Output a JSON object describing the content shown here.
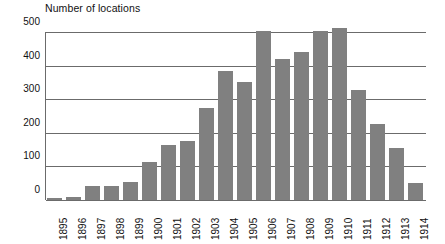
{
  "chart_data": {
    "type": "bar",
    "title": "Number of locations",
    "xlabel": "",
    "ylabel": "",
    "ylim": [
      0,
      500
    ],
    "yticks": [
      0,
      100,
      200,
      300,
      400,
      500
    ],
    "grid": true,
    "legend": false,
    "legend_position": "none",
    "bar_color": "#808080",
    "axis_color": "#6b6b6b",
    "categories": [
      "1895",
      "1896",
      "1897",
      "1898",
      "1899",
      "1900",
      "1901",
      "1902",
      "1903",
      "1904",
      "1905",
      "1906",
      "1907",
      "1908",
      "1909",
      "1910",
      "1911",
      "1912",
      "1913",
      "1914"
    ],
    "values": [
      6,
      8,
      43,
      41,
      54,
      113,
      165,
      177,
      275,
      383,
      352,
      503,
      421,
      440,
      503,
      512,
      327,
      227,
      155,
      52
    ]
  }
}
